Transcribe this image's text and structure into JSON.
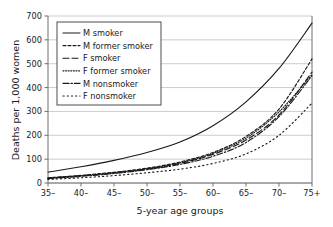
{
  "chart_data": {
    "type": "line",
    "title": "",
    "xlabel": "5-year age groups",
    "ylabel": "Deaths per 1,000 women",
    "categories": [
      "35–",
      "40–",
      "45–",
      "50–",
      "55–",
      "60–",
      "65–",
      "70–",
      "75+"
    ],
    "ylim": [
      0,
      700
    ],
    "yticks": [
      0,
      100,
      200,
      300,
      400,
      500,
      600,
      700
    ],
    "ytick_labels": [
      "0",
      "100",
      "200",
      "300",
      "400",
      "500",
      "600",
      "700"
    ],
    "grid": "horizontal",
    "legend_position": "top-left",
    "series": [
      {
        "name": "M smoker",
        "dash": "solid",
        "color": "#1a1a1a",
        "values": [
          45,
          68,
          95,
          128,
          172,
          240,
          340,
          480,
          670
        ]
      },
      {
        "name": "M former smoker",
        "dash": "dashed-short",
        "color": "#1a1a1a",
        "values": [
          22,
          32,
          45,
          62,
          88,
          128,
          195,
          310,
          520
        ]
      },
      {
        "name": "F smoker",
        "dash": "dashed-long",
        "color": "#1a1a1a",
        "values": [
          20,
          30,
          42,
          58,
          82,
          120,
          180,
          285,
          465
        ]
      },
      {
        "name": "F former smoker",
        "dash": "dotted-fine",
        "color": "#1a1a1a",
        "values": [
          21,
          31,
          43,
          60,
          85,
          124,
          188,
          298,
          455
        ]
      },
      {
        "name": "M nonsmoker",
        "dash": "dash-dot",
        "color": "#1a1a1a",
        "values": [
          18,
          28,
          40,
          56,
          78,
          112,
          170,
          278,
          450
        ]
      },
      {
        "name": "F nonsmoker",
        "dash": "dotted-wide",
        "color": "#1a1a1a",
        "values": [
          15,
          22,
          31,
          43,
          58,
          82,
          122,
          200,
          335
        ]
      }
    ]
  },
  "legend": {
    "items": [
      {
        "label": "M smoker"
      },
      {
        "label": "M former smoker"
      },
      {
        "label": "F smoker"
      },
      {
        "label": "F former smoker"
      },
      {
        "label": "M nonsmoker"
      },
      {
        "label": "F nonsmoker"
      }
    ]
  },
  "colors": {
    "ink": "#1a1a1a",
    "grid": "#bfbfbf",
    "axis": "#6e6e6e",
    "background": "#ffffff"
  }
}
